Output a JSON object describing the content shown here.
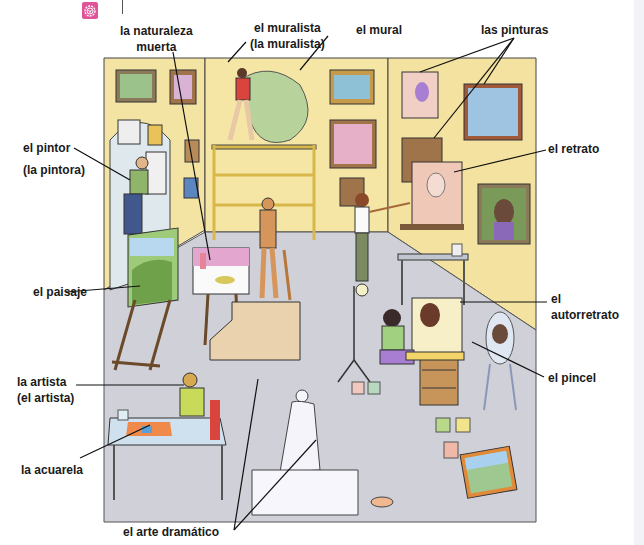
{
  "header": {
    "badge_icon": "flower-badge-icon",
    "badge_color": "#e0559a"
  },
  "scene": {
    "description": "Illustrated art studio scene",
    "colors": {
      "wall": "#f3e4a4",
      "floor": "#cfd0d8",
      "outline": "#333333"
    }
  },
  "labels": {
    "naturaleza_muerta": "la naturaleza muerta",
    "naturaleza_muerta_l1": "la naturaleza",
    "naturaleza_muerta_l2": "muerta",
    "muralista_l1": "el muralista",
    "muralista_l2": "(la muralista)",
    "mural": "el mural",
    "pinturas": "las pinturas",
    "pintor_l1": "el pintor",
    "pintor_l2": "(la pintora)",
    "retrato": "el retrato",
    "paisaje": "el paisaje",
    "autorretrato_l1": "el",
    "autorretrato_l2": "autorretrato",
    "artista_l1": "la artista",
    "artista_l2": "(el artista)",
    "pincel": "el pincel",
    "acuarela": "la acuarela",
    "arte_dramatico": "el arte dramático"
  }
}
